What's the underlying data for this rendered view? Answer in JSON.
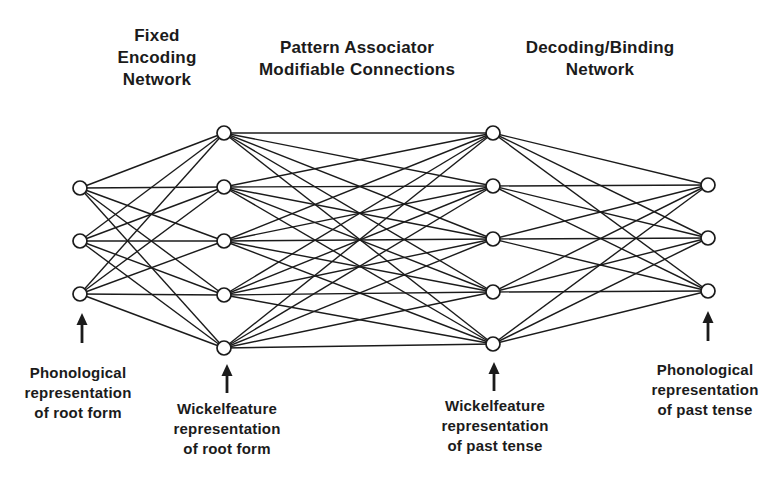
{
  "figure": {
    "background": "#ffffff",
    "ink": "#1b1b1b"
  },
  "labels": {
    "top": [
      {
        "id": "fixed-encoding-network",
        "text": "Fixed\nEncoding\nNetwork"
      },
      {
        "id": "pattern-associator",
        "text": "Pattern Associator\nModifiable Connections"
      },
      {
        "id": "decoding-binding-network",
        "text": "Decoding/Binding\nNetwork"
      }
    ],
    "bottom": [
      {
        "id": "phonological-root",
        "text": "Phonological\nrepresentation\nof root form"
      },
      {
        "id": "wickelfeature-root",
        "text": "Wickelfeature\nrepresentation\nof root form"
      },
      {
        "id": "wickelfeature-past",
        "text": "Wickelfeature\nrepresentation\nof past tense"
      },
      {
        "id": "phonological-past",
        "text": "Phonological\nrepresentation\nof past tense"
      }
    ]
  },
  "network": {
    "node_radius": 7,
    "edge_width": 1.4,
    "node_stroke_width": 1.7,
    "layers": [
      {
        "name": "phonological-input-units",
        "x": 80,
        "ys": [
          188,
          241,
          294
        ]
      },
      {
        "name": "wickelfeature-input-units",
        "x": 224,
        "ys": [
          133,
          187,
          241,
          295,
          348
        ]
      },
      {
        "name": "wickelfeature-output-units",
        "x": 493,
        "ys": [
          133,
          186,
          239,
          292,
          344
        ]
      },
      {
        "name": "phonological-output-units",
        "x": 708,
        "ys": [
          185,
          238,
          291
        ]
      }
    ],
    "connections": "each layer fully connected to the next",
    "arrows": [
      {
        "x": 82,
        "tip_y": 313,
        "tail_y": 343
      },
      {
        "x": 227,
        "tip_y": 364,
        "tail_y": 393
      },
      {
        "x": 494,
        "tip_y": 362,
        "tail_y": 391
      },
      {
        "x": 708,
        "tip_y": 311,
        "tail_y": 341
      }
    ]
  }
}
